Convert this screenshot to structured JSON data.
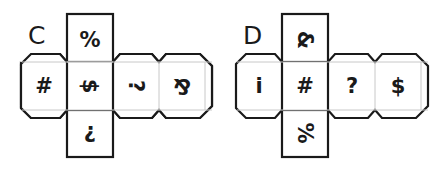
{
  "nets": [
    {
      "label": "C",
      "faces": {
        "top": {
          "symbol": "%",
          "rotation": 0
        },
        "left": {
          "symbol": "#",
          "rotation": 0
        },
        "center": {
          "symbol": "$",
          "rotation": 90
        },
        "right1": {
          "symbol": "?",
          "rotation": 90,
          "display": "·–"
        },
        "right2": {
          "symbol": "&",
          "rotation": 180
        },
        "bottom": {
          "symbol": "?",
          "rotation": 180
        }
      }
    },
    {
      "label": "D",
      "faces": {
        "top": {
          "symbol": "&",
          "rotation": 90
        },
        "left": {
          "symbol": "i",
          "rotation": 0
        },
        "center": {
          "symbol": "#",
          "rotation": 0
        },
        "right1": {
          "symbol": "?",
          "rotation": 0
        },
        "right2": {
          "symbol": "$",
          "rotation": 0
        },
        "bottom": {
          "symbol": "%",
          "rotation": 90
        }
      }
    }
  ],
  "colors": {
    "line": "#1a1a1a",
    "fold": "#c8c8c8",
    "background": "#ffffff"
  }
}
